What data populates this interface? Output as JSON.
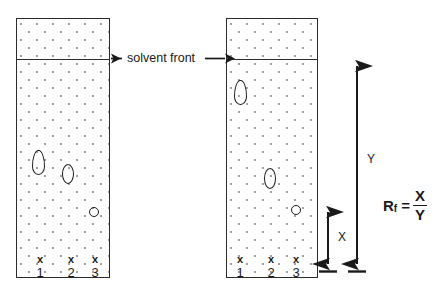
{
  "diagram": {
    "solvent_front_label": "solvent front",
    "formula": {
      "symbol": "R",
      "subscript": "f",
      "equals": "=",
      "numerator": "X",
      "denominator": "Y"
    },
    "measurements": {
      "x_label": "X",
      "y_label": "Y"
    },
    "colors": {
      "ink": "#1a1a1a",
      "plate_border": "#2b2b2b",
      "plate_fill": "#ffffff",
      "dot_texture": "#9a9a9a"
    },
    "plates": [
      {
        "name": "left-plate",
        "lanes": [
          {
            "mark": "x",
            "number": "1"
          },
          {
            "mark": "x",
            "number": "2"
          },
          {
            "mark": "x",
            "number": "3"
          }
        ],
        "spots": [
          {
            "lane": "1",
            "shape": "teardrop"
          },
          {
            "lane": "2",
            "shape": "oval"
          },
          {
            "lane": "3",
            "shape": "dot"
          }
        ]
      },
      {
        "name": "right-plate",
        "lanes": [
          {
            "mark": "x",
            "number": "1"
          },
          {
            "mark": "x",
            "number": "2"
          },
          {
            "mark": "x",
            "number": "3"
          }
        ],
        "spots": [
          {
            "lane": "1",
            "shape": "teardrop"
          },
          {
            "lane": "2",
            "shape": "oval"
          },
          {
            "lane": "3",
            "shape": "dot"
          }
        ]
      }
    ]
  }
}
